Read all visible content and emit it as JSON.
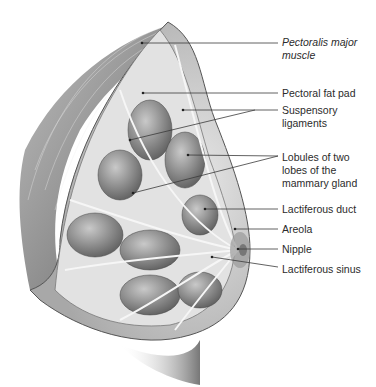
{
  "figure": {
    "colors": {
      "tissue_dark": "#6e6e6e",
      "tissue_mid": "#9a9a9a",
      "tissue_light": "#d8d8d8",
      "ducts": "#f2f2f2",
      "leader": "#3a3a3a",
      "text": "#2b2b2b"
    }
  },
  "labels": [
    {
      "id": "pectoralis",
      "text": "Pectoralis major\nmuscle",
      "italic": true
    },
    {
      "id": "fat-pad",
      "text": "Pectoral fat pad",
      "italic": false
    },
    {
      "id": "suspensory",
      "text": "Suspensory\nligaments",
      "italic": false
    },
    {
      "id": "lobules",
      "text": "Lobules of two\nlobes of the\nmammary gland",
      "italic": false
    },
    {
      "id": "duct",
      "text": "Lactiferous duct",
      "italic": false
    },
    {
      "id": "areola",
      "text": "Areola",
      "italic": false
    },
    {
      "id": "nipple",
      "text": "Nipple",
      "italic": false
    },
    {
      "id": "sinus",
      "text": "Lactiferous sinus",
      "italic": false
    }
  ]
}
